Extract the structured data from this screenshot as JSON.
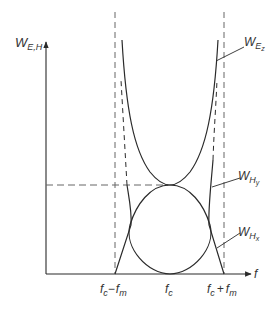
{
  "diagram": {
    "type": "energy-frequency plot",
    "y_axis": {
      "label_main": "W",
      "label_sub": "E,H"
    },
    "x_axis": {
      "label": "f"
    },
    "ticks": [
      {
        "id": "fc-minus-fm",
        "main1": "f",
        "sub1": "c",
        "op": "−",
        "main2": "f",
        "sub2": "m"
      },
      {
        "id": "fc",
        "main1": "f",
        "sub1": "c"
      },
      {
        "id": "fc-plus-fm",
        "main1": "f",
        "sub1": "c",
        "op": "+",
        "main2": "f",
        "sub2": "m"
      }
    ],
    "curves": [
      {
        "id": "W_Ez",
        "main": "W",
        "sub": "E",
        "subsub": "z",
        "shape": "U-shaped, asymptotic to fc±fm, minimum at fc"
      },
      {
        "id": "W_Hy",
        "main": "W",
        "sub": "H",
        "subsub": "y",
        "shape": "steep rising curve near fc±fm"
      },
      {
        "id": "W_Hx",
        "main": "W",
        "sub": "H",
        "subsub": "x",
        "shape": "elliptical arch, maximum at fc"
      }
    ],
    "colors": {
      "line": "#2a2a2a",
      "dashed": "#666666",
      "text": "#333333"
    }
  }
}
